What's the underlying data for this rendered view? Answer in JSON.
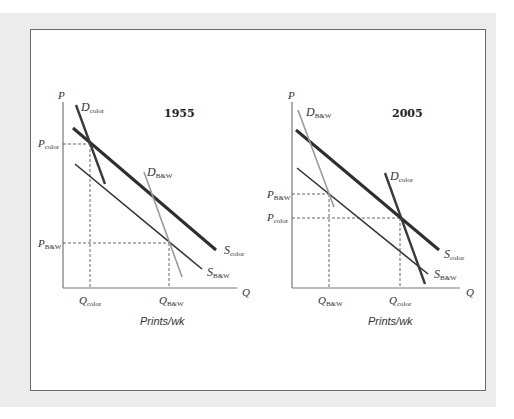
{
  "figure": {
    "colors": {
      "background": "#ffffff",
      "panel": "#ececec",
      "frame_border": "#6a6a6a",
      "axis": "#777777",
      "s_color_line": "#2e2e2e",
      "s_bw_line": "#333333",
      "d_color_line": "#3a3a3a",
      "d_bw_line": "#9a9a9a",
      "dashed": "#555555"
    },
    "panels": [
      {
        "year": "1955",
        "y_axis_label": "P",
        "x_axis_label": "Q",
        "x_units": "Prints/wk",
        "price_labels": [
          {
            "main": "P",
            "sub": "color"
          },
          {
            "main": "P",
            "sub": "B&W"
          }
        ],
        "quantity_labels": [
          {
            "main": "Q",
            "sub": "color"
          },
          {
            "main": "Q",
            "sub": "B&W"
          }
        ],
        "curve_labels": {
          "d_color": {
            "main": "D",
            "sub": "color"
          },
          "d_bw": {
            "main": "D",
            "sub": "B&W"
          },
          "s_color": {
            "main": "S",
            "sub": "color"
          },
          "s_bw": {
            "main": "S",
            "sub": "B&W"
          }
        }
      },
      {
        "year": "2005",
        "y_axis_label": "P",
        "x_axis_label": "Q",
        "x_units": "Prints/wk",
        "price_labels": [
          {
            "main": "P",
            "sub": "B&W"
          },
          {
            "main": "P",
            "sub": "color"
          }
        ],
        "quantity_labels": [
          {
            "main": "Q",
            "sub": "B&W"
          },
          {
            "main": "Q",
            "sub": "color"
          }
        ],
        "curve_labels": {
          "d_bw": {
            "main": "D",
            "sub": "B&W"
          },
          "d_color": {
            "main": "D",
            "sub": "color"
          },
          "s_color": {
            "main": "S",
            "sub": "color"
          },
          "s_bw": {
            "main": "S",
            "sub": "B&W"
          }
        }
      }
    ]
  }
}
